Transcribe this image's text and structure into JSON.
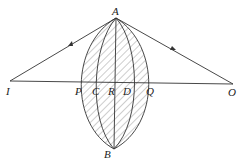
{
  "diagram": {
    "points": {
      "A": "A",
      "B": "B",
      "I": "I",
      "O": "O",
      "P": "P",
      "C": "C",
      "R": "R",
      "D": "D",
      "Q": "Q"
    },
    "colors": {
      "line": "#333333",
      "background": "#ffffff"
    }
  }
}
